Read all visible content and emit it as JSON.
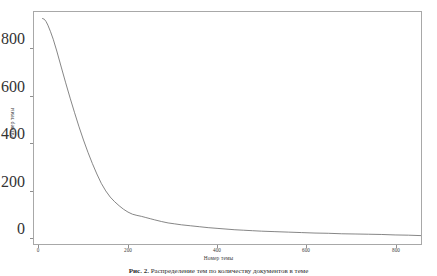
{
  "figure": {
    "background_color": "#ffffff",
    "frame_color": "#a8a8a8",
    "line_color": "#6f6f6f",
    "caption_prefix": "Рис. 2.",
    "caption_text": "Распределение тем по количеству документов в теме"
  },
  "axes": {
    "x_label": "Номер темы",
    "y_label": "Размер темы",
    "x_ticks": [
      "0",
      "200",
      "400",
      "600",
      "800"
    ],
    "y_ticks": [
      "0",
      "200",
      "400",
      "600",
      "800"
    ]
  },
  "chart_data": {
    "type": "line",
    "title": "",
    "subtitle": "",
    "xlabel": "Номер темы",
    "ylabel": "Размер темы",
    "xlim": [
      0,
      870
    ],
    "ylim": [
      0,
      960
    ],
    "xticks": [
      0,
      200,
      400,
      600,
      800
    ],
    "yticks": [
      0,
      200,
      400,
      600,
      800
    ],
    "grid": false,
    "legend": null,
    "legend_position": "none",
    "annotations": [],
    "series": [
      {
        "name": "Размер темы",
        "color": "#6f6f6f",
        "x": [
          8,
          12,
          16,
          20,
          26,
          32,
          40,
          50,
          60,
          70,
          80,
          90,
          100,
          110,
          120,
          130,
          140,
          150,
          160,
          170,
          180,
          190,
          200,
          210,
          220,
          230,
          240,
          250,
          260,
          275,
          290,
          305,
          320,
          340,
          360,
          380,
          400,
          420,
          440,
          460,
          480,
          500,
          530,
          560,
          590,
          620,
          650,
          680,
          710,
          740,
          770,
          800,
          830,
          860
        ],
        "y": [
          928,
          925,
          915,
          900,
          872,
          840,
          790,
          722,
          655,
          590,
          528,
          468,
          412,
          360,
          312,
          268,
          228,
          196,
          170,
          150,
          133,
          118,
          106,
          97,
          92,
          88,
          83,
          78,
          73,
          66,
          60,
          56,
          52,
          48,
          44,
          40,
          37,
          34,
          31,
          29,
          27,
          25,
          23,
          21,
          19,
          17,
          16,
          14,
          13,
          12,
          11,
          9,
          8,
          6
        ]
      }
    ]
  }
}
